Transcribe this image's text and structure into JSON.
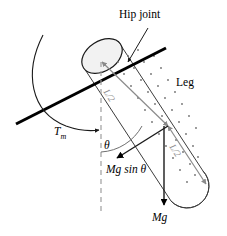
{
  "figure": {
    "background_color": "#ffffff",
    "labels": {
      "hip_joint": "Hip joint",
      "leg": "Leg",
      "torque": "T",
      "torque_subscript": "m",
      "theta": "θ",
      "mg_sin_theta": "Mg sin  θ",
      "mg": "Mg",
      "half_length_upper": "L/2",
      "half_length_lower": "L/2"
    },
    "colors": {
      "stroke": "#1a1a1a",
      "thick_line": "#000000",
      "dimension_gray": "#8a8a8a",
      "dashed_gray": "#9e9e9e",
      "dot_fill": "#6f6f6f",
      "cap_fill": "#f2f2f2"
    },
    "geometry": {
      "hip_joint_point": [
        128,
        62
      ],
      "cylinder_axis_angle_deg": 57,
      "midpoint": [
        168,
        126
      ],
      "vertical_dashed_from": [
        101,
        62
      ],
      "vertical_dashed_to": [
        101,
        214
      ]
    }
  }
}
